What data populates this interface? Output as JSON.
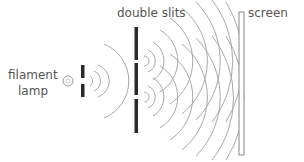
{
  "labels": {
    "double_slits": "double slits",
    "screen": "screen",
    "filament_lamp_line1": "filament",
    "filament_lamp_line2": "lamp"
  },
  "colors": {
    "wave": "#a8a8a8",
    "barrier": "#2a2a2a",
    "text": "#555555",
    "screen_outline": "#888888"
  }
}
